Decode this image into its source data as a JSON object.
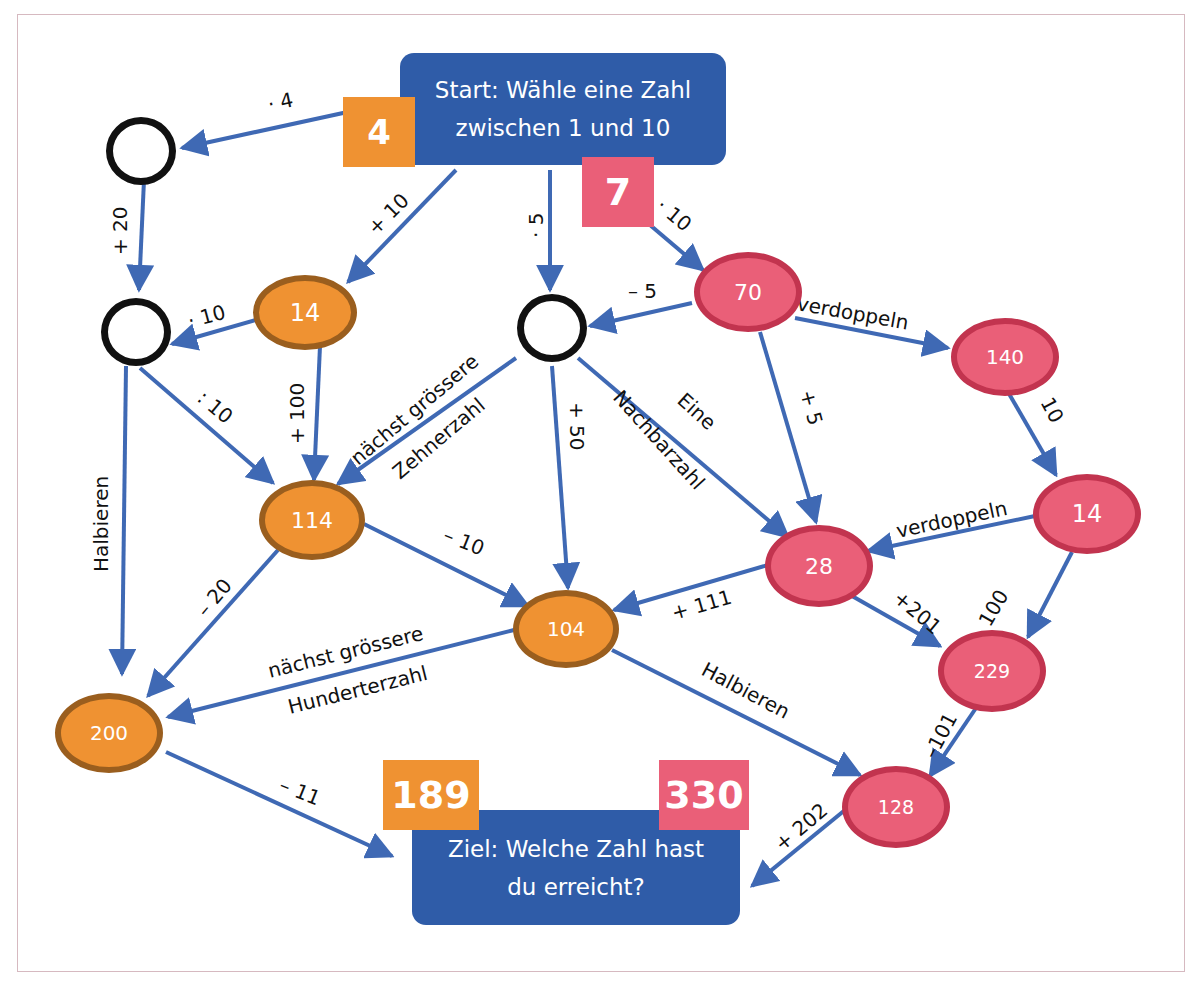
{
  "colors": {
    "box_blue": "#2f5ca8",
    "arrow_blue": "#3f69b4",
    "orange_fill": "#ef9232",
    "orange_border": "#9a5e1e",
    "pink_fill": "#ea5f78",
    "pink_border": "#c2344f",
    "frame": "#d6b9c0"
  },
  "start": {
    "line1": "Start: Wähle eine Zahl",
    "line2": "zwischen 1 und 10",
    "badge_orange": "4",
    "badge_pink": "7"
  },
  "goal": {
    "line1": "Ziel: Welche Zahl hast",
    "line2": "du erreicht?",
    "badge_orange": "189",
    "badge_pink": "330"
  },
  "nodes": {
    "empty_a": "",
    "empty_b": "",
    "empty_c": "",
    "n14_orange": "14",
    "n114": "114",
    "n104": "104",
    "n200": "200",
    "n70": "70",
    "n140": "140",
    "n14_pink": "14",
    "n28": "28",
    "n229": "229",
    "n128": "128"
  },
  "edges": {
    "start_to_a": "· 4",
    "a_to_b": "+ 20",
    "start_to_14": "+ 10",
    "start_to_c": "· 5",
    "start_to_70": "· 10",
    "n14_to_b": "· 10",
    "n14_to_114": "+ 100",
    "b_to_114": ": 10",
    "b_to_200": "Halbieren",
    "c_to_114_line1": "nächst grössere",
    "c_to_114_line2": "Zehnerzahl",
    "c_to_104": "+ 50",
    "c_to_28_line1": "Eine",
    "c_to_28_line2": "Nachbarzahl",
    "n70_to_c": "– 5",
    "n70_to_140": "verdoppeln",
    "n70_to_28": "+ 5",
    "n140_to_14": "10",
    "n14_to_28": "verdoppeln",
    "n14_to_229": "100",
    "n114_to_104": "– 10",
    "n114_to_200": "– 20",
    "n28_to_104": "+ 111",
    "n28_to_229": "+201",
    "n104_to_200_line1": "nächst grössere",
    "n104_to_200_line2": "Hunderterzahl",
    "n104_to_128": "Halbieren",
    "n229_to_128": "–101",
    "n200_to_goal": "– 11",
    "n128_to_goal": "+ 202"
  }
}
